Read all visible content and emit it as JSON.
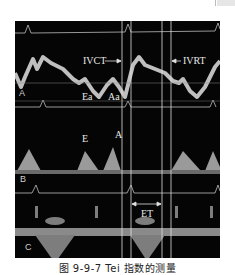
{
  "figure": {
    "caption": "图 9-9-7  Tei 指数的测量",
    "panels": [
      {
        "id": "A",
        "label": "A",
        "annotations": [
          "Ea",
          "Aa",
          "IVCT",
          "IVRT"
        ]
      },
      {
        "id": "B",
        "label": "B",
        "annotations": [
          "E",
          "A"
        ]
      },
      {
        "id": "C",
        "label": "C",
        "annotations": [
          "ET"
        ]
      }
    ],
    "labels": {
      "ivct": "IVCT",
      "ivrt": "IVRT",
      "ea": "Ea",
      "aa": "Aa",
      "e": "E",
      "a": "A",
      "et": "ET",
      "panel_a": "A",
      "panel_b": "B",
      "panel_c": "C"
    },
    "colors": {
      "background": "#050505",
      "trace": "#cfcfcf",
      "marker_lines": "#e0e0e0"
    }
  }
}
